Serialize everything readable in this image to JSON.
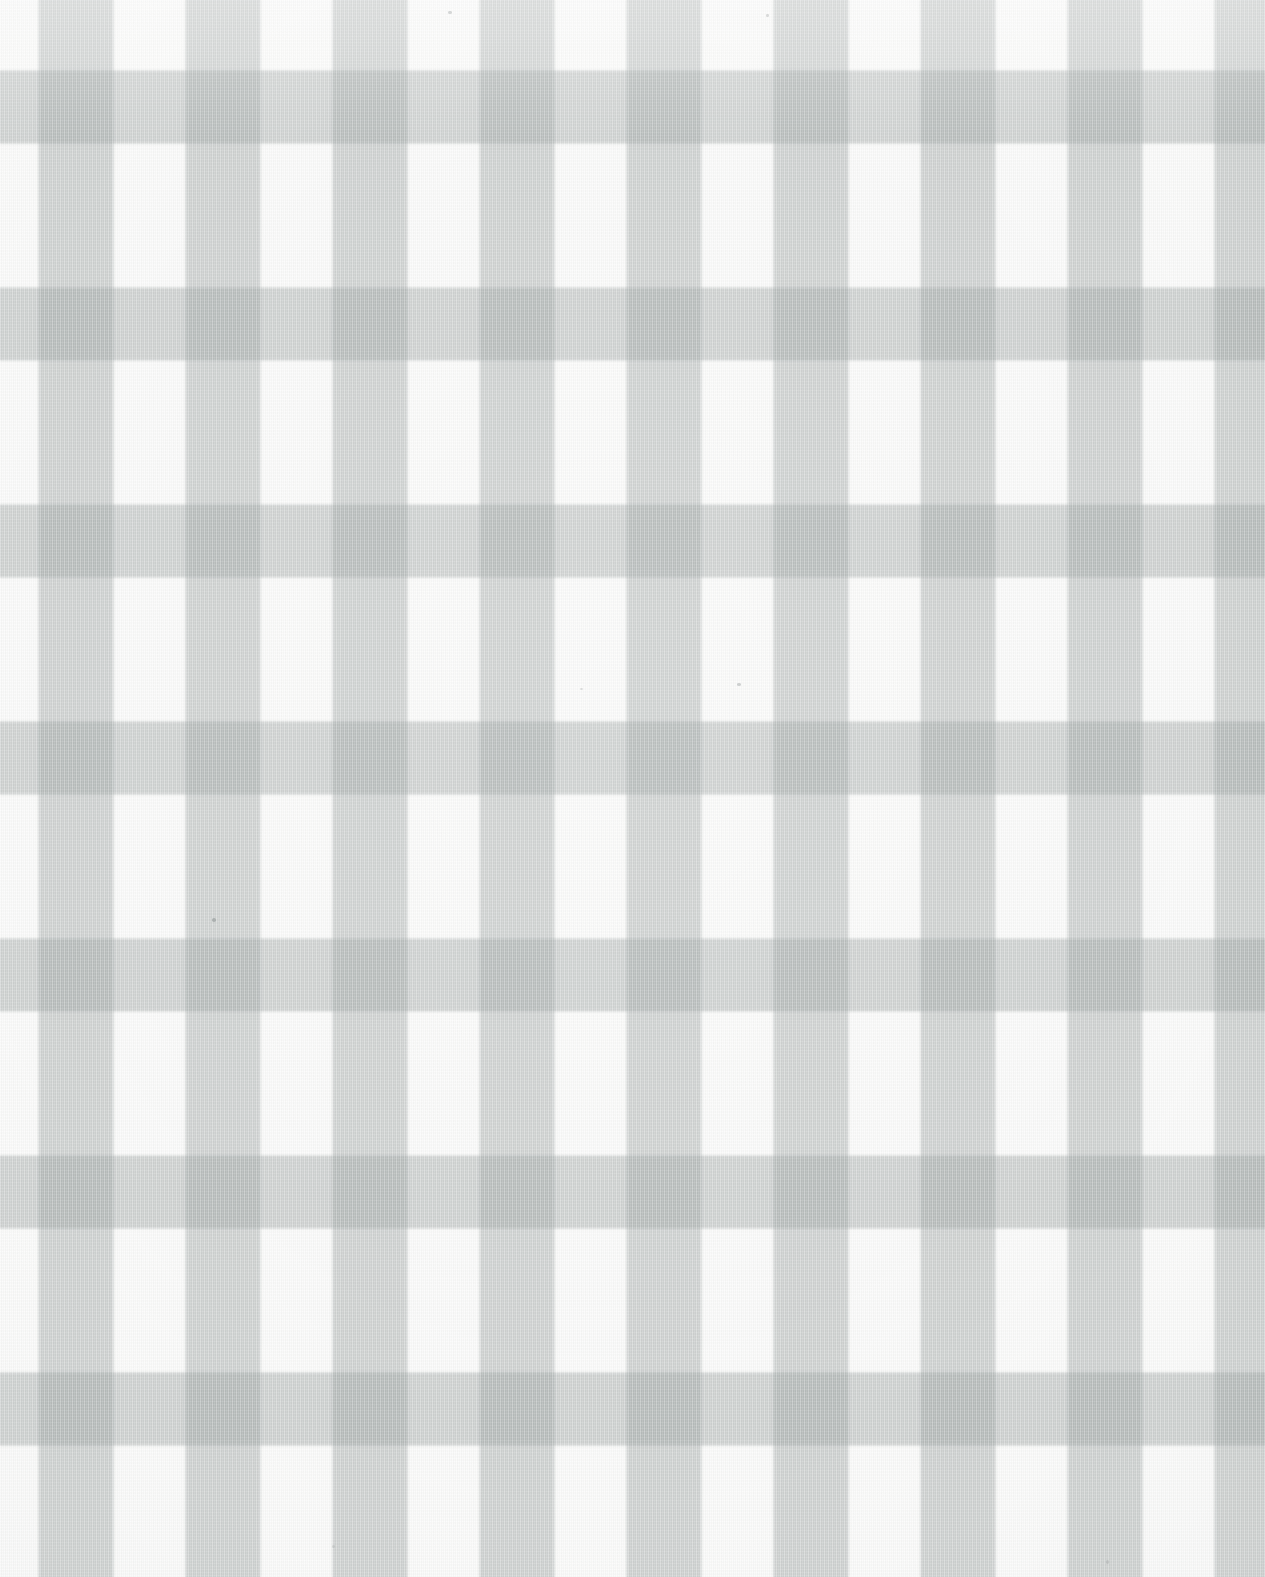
{
  "swatch": {
    "title": "Gingham Check Fabric Swatch",
    "description": "Close-up scan of a pale grey and white gingham (buffalo check) woven cotton textile.",
    "width_px": 1265,
    "height_px": 1577,
    "pattern_name": "gingham-check",
    "weave": "plain-weave cotton"
  },
  "palette": {
    "ground": "#fbfbfa",
    "ground_label": "white",
    "mid": "#e4e6e6",
    "mid_label": "light grey",
    "dark": "#c6c8c8",
    "dark_label": "grey",
    "band_ink": "rgba(151,158,158,0.47)",
    "fleck": "#8e9393"
  },
  "geometry": {
    "period_px": 147,
    "band_width_px": 75,
    "gap_px": 72,
    "warp_offset_px": 38,
    "weft_offset_px": 70,
    "columns_visible": 9,
    "rows_visible": 11
  },
  "layers": [
    {
      "id": "warp-layer",
      "label": "Vertical warp stripes",
      "orientation": "vertical"
    },
    {
      "id": "weft-layer",
      "label": "Horizontal weft stripes",
      "orientation": "horizontal"
    },
    {
      "id": "weave-warp",
      "label": "Warp thread striation",
      "orientation": "vertical"
    },
    {
      "id": "weave-weft",
      "label": "Weft thread striation",
      "orientation": "horizontal"
    },
    {
      "id": "vignette",
      "label": "Scan lighting falloff",
      "orientation": "radial"
    }
  ],
  "flecks": [
    {
      "x": 212,
      "y": 918,
      "w": 4,
      "h": 4,
      "opacity": 0.55
    },
    {
      "x": 448,
      "y": 11,
      "w": 4,
      "h": 3,
      "opacity": 0.34
    },
    {
      "x": 766,
      "y": 14,
      "w": 3,
      "h": 3,
      "opacity": 0.3
    },
    {
      "x": 737,
      "y": 683,
      "w": 4,
      "h": 3,
      "opacity": 0.4
    },
    {
      "x": 580,
      "y": 688,
      "w": 3,
      "h": 2,
      "opacity": 0.26
    },
    {
      "x": 1106,
      "y": 1560,
      "w": 3,
      "h": 4,
      "opacity": 0.28
    },
    {
      "x": 332,
      "y": 1545,
      "w": 3,
      "h": 3,
      "opacity": 0.22
    }
  ]
}
